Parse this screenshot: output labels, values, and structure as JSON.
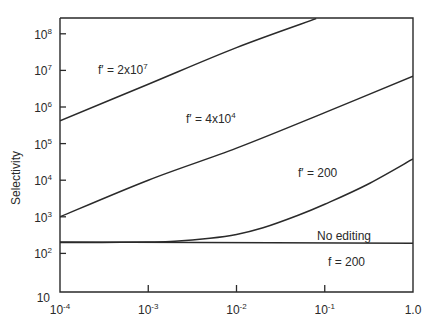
{
  "chart_data": {
    "type": "line",
    "title": "",
    "xlabel": "",
    "ylabel": "Selectivity",
    "x_scale": "log",
    "y_scale": "log",
    "xlim": [
      0.0001,
      1.0
    ],
    "ylim": [
      10,
      300000000
    ],
    "grid": false,
    "legend": "inline labels",
    "x_ticks": [
      {
        "value": 0.0001,
        "base": "10",
        "exp": "-4"
      },
      {
        "value": 0.001,
        "base": "10",
        "exp": "-3"
      },
      {
        "value": 0.01,
        "base": "10",
        "exp": "-2"
      },
      {
        "value": 0.1,
        "base": "10",
        "exp": "-1"
      },
      {
        "value": 1.0,
        "base": "1.0",
        "exp": ""
      }
    ],
    "y_ticks": [
      {
        "value": 10,
        "base": "10",
        "exp": ""
      },
      {
        "value": 100,
        "base": "10",
        "exp": "2"
      },
      {
        "value": 1000,
        "base": "10",
        "exp": "3"
      },
      {
        "value": 10000,
        "base": "10",
        "exp": "4"
      },
      {
        "value": 100000,
        "base": "10",
        "exp": "5"
      },
      {
        "value": 1000000,
        "base": "10",
        "exp": "6"
      },
      {
        "value": 10000000,
        "base": "10",
        "exp": "7"
      },
      {
        "value": 100000000,
        "base": "10",
        "exp": "8"
      }
    ],
    "series": [
      {
        "name": "f' = 2x10^7",
        "label": "f′ = 2x10",
        "label_exp": "7",
        "x": [
          0.0001,
          0.001,
          0.01,
          0.08
        ],
        "y": [
          420000,
          4200000,
          42000000,
          260000000
        ]
      },
      {
        "name": "f' = 4x10^4",
        "label": "f′ = 4x10",
        "label_exp": "4",
        "x": [
          0.0001,
          0.001,
          0.01,
          0.1,
          1.0
        ],
        "y": [
          1000,
          10000,
          75000,
          700000,
          7000000
        ]
      },
      {
        "name": "f' = 200",
        "label": "f′ = 200",
        "label_exp": "",
        "x": [
          0.0001,
          0.0003,
          0.001,
          0.002,
          0.005,
          0.01,
          0.02,
          0.05,
          0.1,
          0.3,
          1.0
        ],
        "y": [
          200,
          200,
          205,
          215,
          260,
          330,
          500,
          1100,
          2200,
          7500,
          38000
        ]
      },
      {
        "name": "No editing",
        "label": "No editing",
        "label_exp": "",
        "x": [
          0.0001,
          1.0
        ],
        "y": [
          205,
          190
        ]
      }
    ],
    "annotations": [
      {
        "text": "f = 200",
        "near": "No editing line, below"
      }
    ]
  },
  "labels": {
    "ylabel": "Selectivity",
    "no_editing": "No editing",
    "f200": "f = 200"
  }
}
